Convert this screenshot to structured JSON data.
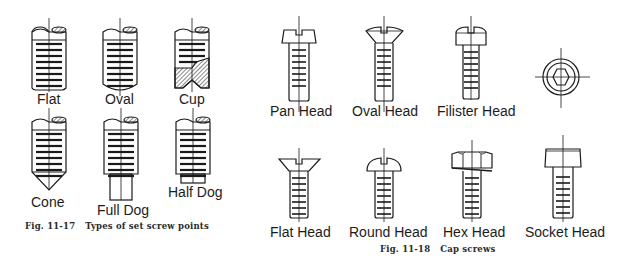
{
  "figures": [
    {
      "number": "Fig. 11-17",
      "caption": "Types of set screw points",
      "items": [
        {
          "label": "Flat"
        },
        {
          "label": "Oval"
        },
        {
          "label": "Cup"
        },
        {
          "label": "Cone"
        },
        {
          "label": "Full Dog"
        },
        {
          "label": "Half Dog"
        }
      ]
    },
    {
      "number": "Fig. 11-18",
      "caption": "Cap screws",
      "items": [
        {
          "label": "Pan Head"
        },
        {
          "label": "Oval Head"
        },
        {
          "label": "Filister Head"
        },
        {
          "label": "Flat Head"
        },
        {
          "label": "Round Head"
        },
        {
          "label": "Hex Head"
        },
        {
          "label": "Socket Head"
        }
      ],
      "end_view": "socket-head-end-view"
    }
  ],
  "colors": {
    "line": "#1a1a1a",
    "background": "#ffffff"
  }
}
